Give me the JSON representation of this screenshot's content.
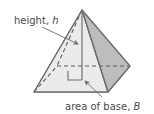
{
  "figure": {
    "labels": {
      "height": {
        "text": "height, ",
        "variable": "h"
      },
      "base": {
        "text": "area of base, ",
        "variable": "B"
      }
    },
    "colors": {
      "background": "#ffffff",
      "left_face": "#ebebeb",
      "right_face": "#bdbdbd",
      "base_face": "#9a9a9a",
      "hidden_face": "#d6d6d6",
      "outline": "#6e6e6e",
      "dashed": "#5a5a5a",
      "height_line": "#7a7a7a",
      "leader": "#8a8a8a",
      "text": "#4a4a4a"
    },
    "geometry": {
      "apex": [
        82,
        10
      ],
      "front_vertex": [
        108,
        92
      ],
      "left_vertex": [
        34,
        92
      ],
      "right_vertex": [
        130,
        66
      ],
      "back_vertex": [
        57,
        66
      ],
      "base_center": [
        82,
        79
      ],
      "height_foot": [
        82,
        79
      ]
    },
    "annotations": {
      "height_leader_from": [
        62,
        28
      ],
      "height_leader_to": [
        80,
        44
      ],
      "base_leader_from": [
        106,
        96
      ],
      "base_leader_to": [
        85,
        80
      ]
    }
  }
}
